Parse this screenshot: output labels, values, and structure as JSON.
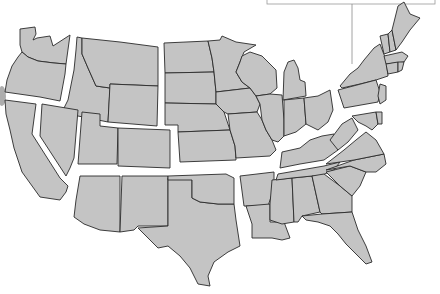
{
  "map": {
    "title": "",
    "subject": "Contiguous United States divided into regions",
    "colors": {
      "land": "#c4c4c4",
      "border": "#2a2a2a",
      "background": "#ffffff",
      "gap": "#ffffff"
    },
    "regions": [
      {
        "name": "Pacific Northwest",
        "states": [
          "WA",
          "OR"
        ]
      },
      {
        "name": "Mountain North",
        "states": [
          "ID",
          "MT",
          "WY"
        ]
      },
      {
        "name": "Great Plains",
        "states": [
          "ND",
          "SD",
          "NE",
          "KS",
          "MN",
          "IA",
          "MO"
        ]
      },
      {
        "name": "Great Lakes / Midwest",
        "states": [
          "WI",
          "IL",
          "MI",
          "IN",
          "OH"
        ]
      },
      {
        "name": "Northeast",
        "states": [
          "NY",
          "PA",
          "NJ",
          "VT",
          "NH",
          "ME",
          "MA",
          "CT",
          "RI"
        ]
      },
      {
        "name": "New England",
        "states": [
          "ME",
          "NH",
          "VT",
          "MA",
          "RI",
          "CT"
        ]
      },
      {
        "name": "Far West",
        "states": [
          "CA",
          "NV",
          "UT",
          "CO"
        ]
      },
      {
        "name": "Southwest",
        "states": [
          "AZ",
          "NM",
          "TX",
          "OK"
        ]
      },
      {
        "name": "South",
        "states": [
          "AR",
          "LA",
          "MS",
          "AL",
          "TN",
          "KY",
          "GA",
          "FL",
          "SC",
          "NC",
          "VA",
          "WV",
          "MD",
          "DE"
        ]
      }
    ],
    "callout": {
      "label": "",
      "visible": true
    }
  }
}
